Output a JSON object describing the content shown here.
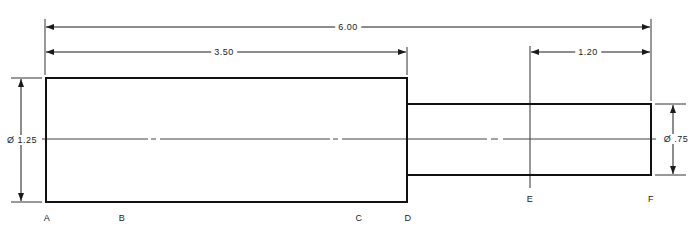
{
  "diagram": {
    "type": "stepped-shaft-technical-drawing",
    "line_color": "#1a1a1a",
    "background": "#ffffff",
    "sections": [
      {
        "name": "large-section",
        "from_point": "A",
        "to_point": "D",
        "diameter_label": "Ø 1.25"
      },
      {
        "name": "small-section",
        "from_point": "D",
        "to_point": "F",
        "diameter_label": "Ø .75"
      }
    ],
    "dimensions": {
      "overall_length": "6.00",
      "large_section_length": "3.50",
      "end_length": "1.20",
      "large_diameter": "Ø 1.25",
      "small_diameter": "Ø .75"
    },
    "points": [
      {
        "label": "A"
      },
      {
        "label": "B"
      },
      {
        "label": "C"
      },
      {
        "label": "D"
      },
      {
        "label": "E"
      },
      {
        "label": "F"
      }
    ]
  }
}
